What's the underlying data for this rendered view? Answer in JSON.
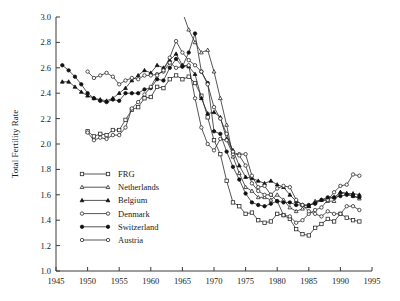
{
  "chart_data": {
    "type": "line",
    "title": "",
    "xlabel": "",
    "ylabel": "Total Fertility Rate",
    "xlim": [
      1945,
      1995
    ],
    "ylim": [
      1.0,
      3.0
    ],
    "xticks": [
      1945,
      1950,
      1955,
      1960,
      1965,
      1970,
      1975,
      1980,
      1985,
      1990,
      1995
    ],
    "yticks": [
      "1.0",
      "1.2",
      "1.4",
      "1.6",
      "1.8",
      "2.0",
      "2.2",
      "2.4",
      "2.6",
      "2.8",
      "3.0"
    ],
    "grid": false,
    "legend_position": "inside-lower-left",
    "series": [
      {
        "name": "FRG",
        "marker": "open-square",
        "x": [
          1950,
          1951,
          1952,
          1953,
          1954,
          1955,
          1956,
          1957,
          1958,
          1959,
          1960,
          1961,
          1962,
          1963,
          1964,
          1965,
          1966,
          1967,
          1968,
          1969,
          1970,
          1971,
          1972,
          1973,
          1974,
          1975,
          1976,
          1977,
          1978,
          1979,
          1980,
          1981,
          1982,
          1983,
          1984,
          1985,
          1986,
          1987,
          1988,
          1989,
          1990,
          1991,
          1992,
          1993
        ],
        "y": [
          2.1,
          2.06,
          2.08,
          2.07,
          2.11,
          2.11,
          2.19,
          2.27,
          2.29,
          2.36,
          2.37,
          2.45,
          2.44,
          2.51,
          2.54,
          2.51,
          2.53,
          2.48,
          2.38,
          2.21,
          2.03,
          1.92,
          1.71,
          1.54,
          1.51,
          1.45,
          1.46,
          1.4,
          1.38,
          1.39,
          1.45,
          1.44,
          1.41,
          1.33,
          1.29,
          1.28,
          1.34,
          1.37,
          1.41,
          1.39,
          1.45,
          1.42,
          1.4,
          1.39
        ]
      },
      {
        "name": "Netherlands",
        "marker": "open-triangle",
        "x": [
          1950,
          1951,
          1952,
          1953,
          1954,
          1955,
          1956,
          1957,
          1958,
          1959,
          1960,
          1961,
          1962,
          1963,
          1964,
          1965,
          1966,
          1967,
          1968,
          1969,
          1970,
          1971,
          1972,
          1973,
          1974,
          1975,
          1976,
          1977,
          1978,
          1979,
          1980,
          1981,
          1982,
          1983,
          1984,
          1985,
          1986,
          1987,
          1988,
          1989,
          1990,
          1991,
          1992,
          1993
        ],
        "y": [
          3.1,
          3.02,
          3.02,
          3.04,
          3.03,
          3.03,
          3.05,
          3.07,
          3.08,
          3.11,
          3.12,
          3.19,
          3.17,
          3.17,
          3.17,
          3.04,
          2.9,
          2.8,
          2.72,
          2.74,
          2.57,
          2.36,
          2.15,
          1.9,
          1.77,
          1.66,
          1.63,
          1.58,
          1.58,
          1.56,
          1.6,
          1.56,
          1.5,
          1.47,
          1.49,
          1.51,
          1.55,
          1.56,
          1.55,
          1.55,
          1.62,
          1.61,
          1.59,
          1.57
        ]
      },
      {
        "name": "Belgium",
        "marker": "fill-triangle",
        "x": [
          1946,
          1947,
          1948,
          1949,
          1950,
          1951,
          1952,
          1953,
          1954,
          1955,
          1956,
          1957,
          1958,
          1959,
          1960,
          1961,
          1962,
          1963,
          1964,
          1965,
          1966,
          1967,
          1968,
          1969,
          1970,
          1971,
          1972,
          1973,
          1974,
          1975,
          1976,
          1977,
          1978,
          1979,
          1980,
          1981,
          1982,
          1983,
          1984,
          1985,
          1986,
          1987,
          1988,
          1989,
          1990,
          1991,
          1992,
          1993
        ],
        "y": [
          2.49,
          2.49,
          2.45,
          2.41,
          2.38,
          2.36,
          2.35,
          2.34,
          2.36,
          2.4,
          2.44,
          2.5,
          2.54,
          2.58,
          2.56,
          2.62,
          2.6,
          2.66,
          2.71,
          2.62,
          2.61,
          2.55,
          2.36,
          2.24,
          2.25,
          2.21,
          2.04,
          1.95,
          1.83,
          1.74,
          1.73,
          1.71,
          1.69,
          1.71,
          1.68,
          1.66,
          1.6,
          1.55,
          1.52,
          1.51,
          1.54,
          1.56,
          1.57,
          1.58,
          1.62,
          1.61,
          1.61,
          1.6
        ]
      },
      {
        "name": "Denmark",
        "marker": "open-circle",
        "x": [
          1950,
          1951,
          1952,
          1953,
          1954,
          1955,
          1956,
          1957,
          1958,
          1959,
          1960,
          1961,
          1962,
          1963,
          1964,
          1965,
          1966,
          1967,
          1968,
          1969,
          1970,
          1971,
          1972,
          1973,
          1974,
          1975,
          1976,
          1977,
          1978,
          1979,
          1980,
          1981,
          1982,
          1983,
          1984,
          1985,
          1986,
          1987,
          1988,
          1989,
          1990,
          1991,
          1992,
          1993
        ],
        "y": [
          2.57,
          2.52,
          2.54,
          2.56,
          2.53,
          2.47,
          2.5,
          2.52,
          2.51,
          2.54,
          2.54,
          2.55,
          2.57,
          2.64,
          2.6,
          2.61,
          2.62,
          2.36,
          2.13,
          2.0,
          1.95,
          2.04,
          2.03,
          1.92,
          1.92,
          1.92,
          1.75,
          1.66,
          1.67,
          1.6,
          1.55,
          1.44,
          1.43,
          1.38,
          1.4,
          1.45,
          1.48,
          1.5,
          1.56,
          1.62,
          1.67,
          1.68,
          1.76,
          1.75
        ]
      },
      {
        "name": "Switzerland",
        "marker": "fill-circle",
        "x": [
          1946,
          1947,
          1948,
          1949,
          1950,
          1951,
          1952,
          1953,
          1954,
          1955,
          1956,
          1957,
          1958,
          1959,
          1960,
          1961,
          1962,
          1963,
          1964,
          1965,
          1966,
          1967,
          1968,
          1969,
          1970,
          1971,
          1972,
          1973,
          1974,
          1975,
          1976,
          1977,
          1978,
          1979,
          1980,
          1981,
          1982,
          1983,
          1984,
          1985,
          1986,
          1987,
          1988,
          1989,
          1990,
          1991,
          1992,
          1993
        ],
        "y": [
          2.62,
          2.58,
          2.53,
          2.47,
          2.4,
          2.36,
          2.34,
          2.33,
          2.35,
          2.34,
          2.4,
          2.4,
          2.4,
          2.43,
          2.44,
          2.51,
          2.5,
          2.6,
          2.67,
          2.61,
          2.72,
          2.87,
          2.57,
          2.48,
          2.1,
          2.08,
          1.94,
          1.82,
          1.72,
          1.61,
          1.54,
          1.52,
          1.51,
          1.53,
          1.55,
          1.54,
          1.54,
          1.52,
          1.52,
          1.52,
          1.53,
          1.56,
          1.58,
          1.58,
          1.59,
          1.6,
          1.59,
          1.58
        ]
      },
      {
        "name": "Austria",
        "marker": "open-circle",
        "x": [
          1950,
          1951,
          1952,
          1953,
          1954,
          1955,
          1956,
          1957,
          1958,
          1959,
          1960,
          1961,
          1962,
          1963,
          1964,
          1965,
          1966,
          1967,
          1968,
          1969,
          1970,
          1971,
          1972,
          1973,
          1974,
          1975,
          1976,
          1977,
          1978,
          1979,
          1980,
          1981,
          1982,
          1983,
          1984,
          1985,
          1986,
          1987,
          1988,
          1989,
          1990,
          1991,
          1992,
          1993
        ],
        "y": [
          2.09,
          2.03,
          2.05,
          2.04,
          2.07,
          2.07,
          2.13,
          2.28,
          2.33,
          2.39,
          2.45,
          2.54,
          2.58,
          2.68,
          2.81,
          2.72,
          2.66,
          2.62,
          2.57,
          2.47,
          2.29,
          2.2,
          2.08,
          1.94,
          1.91,
          1.83,
          1.69,
          1.63,
          1.6,
          1.6,
          1.65,
          1.67,
          1.66,
          1.56,
          1.52,
          1.47,
          1.45,
          1.43,
          1.47,
          1.45,
          1.45,
          1.51,
          1.51,
          1.48
        ]
      }
    ]
  },
  "legend": {
    "items": [
      {
        "label": "FRG",
        "marker": "open-square"
      },
      {
        "label": "Netherlands",
        "marker": "open-triangle"
      },
      {
        "label": "Belgium",
        "marker": "fill-triangle"
      },
      {
        "label": "Denmark",
        "marker": "open-circle"
      },
      {
        "label": "Switzerland",
        "marker": "fill-circle"
      },
      {
        "label": "Austria",
        "marker": "open-circle"
      }
    ]
  }
}
